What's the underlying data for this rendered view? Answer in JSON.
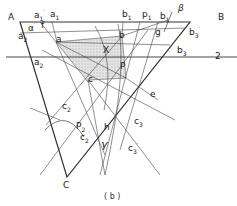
{
  "figure": {
    "caption": "( b )",
    "labels": {
      "A": "A",
      "B": "B",
      "C": "C",
      "a1p": "a",
      "a1": "a",
      "alpha": "α",
      "f": "f",
      "a2p": "a",
      "a": "a",
      "a2": "a",
      "b1": "b",
      "p1": "p",
      "b1p": "b",
      "beta": "β",
      "b": "b",
      "g": "g",
      "b3p": "b",
      "b3": "b",
      "X": "X",
      "P": "P",
      "two": "2",
      "c": "c",
      "e": "e",
      "c2": "c",
      "P2": "P",
      "c2p": "c",
      "h": "h",
      "c3": "c",
      "gamma": "γ",
      "c3p": "c"
    },
    "colors": {
      "line": "#333333",
      "shade": "#d8d8d8"
    }
  }
}
